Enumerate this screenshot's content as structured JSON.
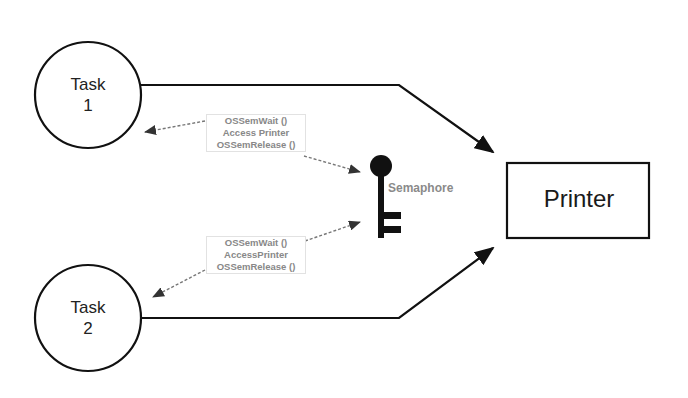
{
  "diagram": {
    "nodes": [
      {
        "id": "task1",
        "shape": "circle",
        "label_line1": "Task",
        "label_line2": "1"
      },
      {
        "id": "task2",
        "shape": "circle",
        "label_line1": "Task",
        "label_line2": "2"
      },
      {
        "id": "printer",
        "shape": "rectangle",
        "label": "Printer"
      },
      {
        "id": "semaphore",
        "shape": "key-icon",
        "label": "Semaphore"
      }
    ],
    "notes": {
      "task1": {
        "line1": "OSSemWait ()",
        "line2": "Access Printer",
        "line3": "OSSemRelease ()"
      },
      "task2": {
        "line1": "OSSemWait ()",
        "line2": "AccessPrinter",
        "line3": "OSSemRelease ()"
      }
    },
    "edges": [
      {
        "from": "task1",
        "to": "printer",
        "style": "solid"
      },
      {
        "from": "task2",
        "to": "printer",
        "style": "solid"
      },
      {
        "from": "task1",
        "to": "semaphore",
        "style": "dashed",
        "bidirectional": true
      },
      {
        "from": "task2",
        "to": "semaphore",
        "style": "dashed",
        "bidirectional": true
      }
    ],
    "colors": {
      "stroke": "#111111",
      "dashed": "#777777",
      "note_text": "#888888"
    }
  }
}
